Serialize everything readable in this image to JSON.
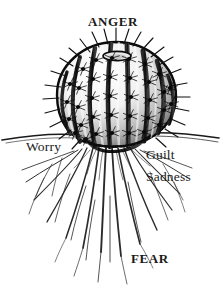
{
  "figure": {
    "background_color": "#ffffff",
    "ink_color": "#1a1a1a",
    "width": 221,
    "height": 308
  },
  "labels": {
    "anger": "ANGER",
    "worry": "Worry",
    "guilt": "Guilt",
    "sadness": "Sadness",
    "fear": "FEAR"
  },
  "illustration": {
    "subject": "barrel-cactus",
    "above_ground": "ribbed spherical barrel cactus with spine clusters",
    "below_ground": "fanned taproot system spreading downward",
    "ground_line": "horizontal soil line crossing the full image width"
  }
}
